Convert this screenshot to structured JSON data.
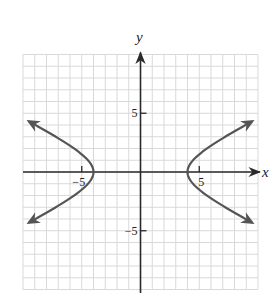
{
  "chart_data": {
    "type": "line",
    "title": "",
    "xlabel": "x",
    "ylabel": "y",
    "xlim": [
      -10,
      10
    ],
    "ylim": [
      -10,
      10
    ],
    "grid": true,
    "grid_step": 1,
    "ticks": {
      "x": [
        {
          "value": -5,
          "label": "−5"
        },
        {
          "value": 5,
          "label": "5"
        }
      ],
      "y": [
        {
          "value": 5,
          "label": "5"
        },
        {
          "value": -5,
          "label": "−5"
        }
      ]
    },
    "equation": "x^2/16 - y^2/4 = 1",
    "series": [
      {
        "name": "right branch",
        "vertex": [
          4,
          0
        ],
        "x": [
          9.5,
          8,
          7,
          6,
          5,
          4.5,
          4,
          4.5,
          5,
          6,
          7,
          8,
          9.5
        ],
        "y": [
          4.31,
          3.46,
          2.87,
          2.24,
          1.5,
          1.03,
          0,
          -1.03,
          -1.5,
          -2.24,
          -2.87,
          -3.46,
          -4.31
        ],
        "arrows": "both ends"
      },
      {
        "name": "left branch",
        "vertex": [
          -4,
          0
        ],
        "x": [
          -9.5,
          -8,
          -7,
          -6,
          -5,
          -4.5,
          -4,
          -4.5,
          -5,
          -6,
          -7,
          -8,
          -9.5
        ],
        "y": [
          4.31,
          3.46,
          2.87,
          2.24,
          1.5,
          1.03,
          0,
          -1.03,
          -1.5,
          -2.24,
          -2.87,
          -3.46,
          -4.31
        ],
        "arrows": "both ends"
      }
    ]
  },
  "colors": {
    "grid": "#d9d9d9",
    "axis": "#2a2a2a",
    "curve": "#555555"
  }
}
